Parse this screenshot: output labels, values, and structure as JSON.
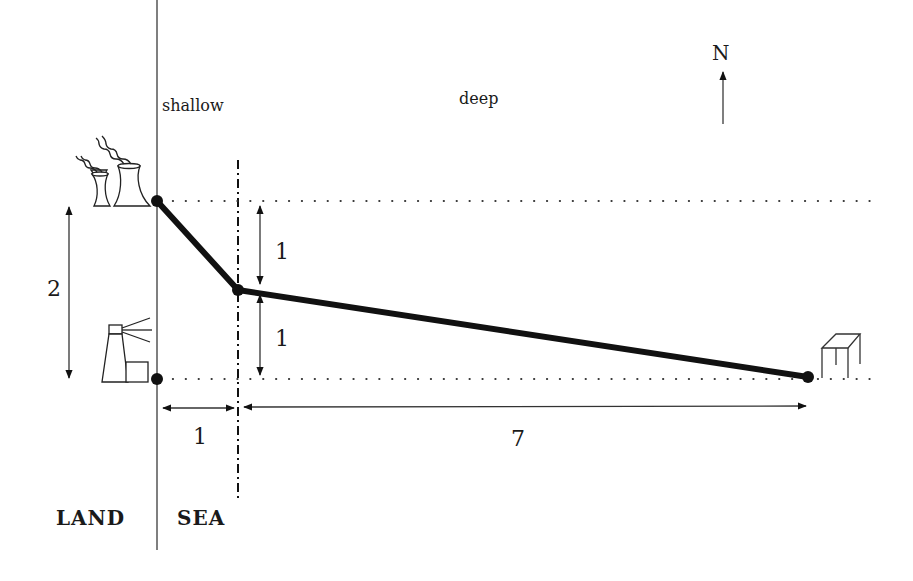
{
  "diagram": {
    "type": "pipeline-route-map",
    "regions": {
      "land_label": "LAND",
      "sea_label": "SEA",
      "shallow_label": "shallow",
      "deep_label": "deep"
    },
    "compass": {
      "label": "N"
    },
    "dimensions": {
      "vertical_total": "2",
      "vertical_upper": "1",
      "vertical_lower": "1",
      "horizontal_shallow": "1",
      "horizontal_deep": "7"
    },
    "icons": [
      {
        "name": "power-plant",
        "description": "cooling towers with smoke (pipeline source)"
      },
      {
        "name": "lighthouse",
        "description": "lighthouse on coast"
      },
      {
        "name": "oil-rig",
        "description": "offshore platform (pipeline end)"
      }
    ],
    "nodes": [
      {
        "id": "A",
        "label": "power plant on shore",
        "coords": [
          0,
          2
        ]
      },
      {
        "id": "B",
        "label": "shallow/deep boundary point",
        "coords": [
          1,
          1
        ]
      },
      {
        "id": "C",
        "label": "offshore rig",
        "coords": [
          8,
          0
        ]
      },
      {
        "id": "D",
        "label": "lighthouse point on shore",
        "coords": [
          0,
          0
        ]
      }
    ],
    "edges": [
      {
        "from": "A",
        "to": "B",
        "style": "thick-solid"
      },
      {
        "from": "B",
        "to": "C",
        "style": "thick-solid"
      }
    ],
    "colors": {
      "ink": "#111111",
      "thin_line": "#555555",
      "background": "#ffffff"
    }
  }
}
